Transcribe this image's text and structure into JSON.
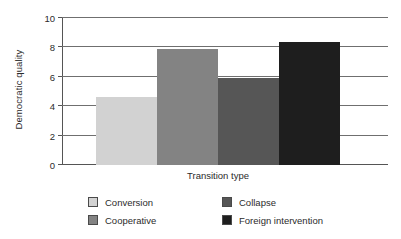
{
  "chart_data": {
    "type": "bar",
    "title": "",
    "xlabel": "Transition type",
    "ylabel": "Democratic quality",
    "categories": [
      "Conversion",
      "Cooperative",
      "Collapse",
      "Foreign intervention"
    ],
    "values": [
      4.6,
      7.9,
      5.9,
      8.4
    ],
    "ylim": [
      0,
      10
    ],
    "yticks": [
      "0",
      "2",
      "4",
      "6",
      "8",
      "10"
    ],
    "ytick_values": [
      0,
      2,
      4,
      6,
      8,
      10
    ],
    "grid": "horizontal",
    "legend_position": "bottom",
    "colors": [
      "#d2d2d2",
      "#838383",
      "#565656",
      "#1e1e1e"
    ],
    "legend": [
      {
        "label": "Conversion",
        "color": "#d2d2d2"
      },
      {
        "label": "Cooperative",
        "color": "#838383"
      },
      {
        "label": "Collapse",
        "color": "#565656"
      },
      {
        "label": "Foreign intervention",
        "color": "#1e1e1e"
      }
    ]
  }
}
